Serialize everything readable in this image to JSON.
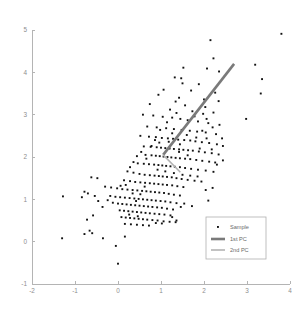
{
  "chart_data": {
    "type": "scatter",
    "title": "",
    "xlabel": "",
    "ylabel": "",
    "xlim": [
      -2,
      4
    ],
    "ylim": [
      -1,
      5
    ],
    "grid": false,
    "legend_position": "lower right",
    "xticks": [
      "-2",
      "-1",
      "0",
      "1",
      "2",
      "3",
      "4"
    ],
    "xtick_values": [
      -2,
      -1,
      0,
      1,
      2,
      3,
      4
    ],
    "yticks": [
      "-1",
      "0",
      "1",
      "2",
      "3",
      "4",
      "5"
    ],
    "ytick_values": [
      -1,
      0,
      1,
      2,
      3,
      4,
      5
    ],
    "legend": [
      {
        "label": "Sample",
        "marker": "point",
        "color": "#121212"
      },
      {
        "label": "1st PC",
        "marker": "line",
        "color": "#7a7a7a",
        "width": 2.6
      },
      {
        "label": "2nd PC",
        "marker": "line",
        "color": "#b3b3b3",
        "width": 1.6
      }
    ],
    "series": [
      {
        "name": "Sample",
        "type": "scatter",
        "marker": "square",
        "marker_size": 1.9,
        "color": "#121212",
        "points": [
          [
            3.8,
            4.91
          ],
          [
            2.15,
            4.76
          ],
          [
            2.22,
            4.33
          ],
          [
            1.52,
            4.11
          ],
          [
            2.07,
            4.09
          ],
          [
            2.35,
            4.02
          ],
          [
            3.19,
            4.18
          ],
          [
            3.35,
            3.84
          ],
          [
            1.32,
            3.88
          ],
          [
            1.47,
            3.86
          ],
          [
            1.5,
            3.74
          ],
          [
            1.88,
            3.72
          ],
          [
            3.32,
            3.5
          ],
          [
            1.06,
            3.59
          ],
          [
            1.7,
            3.57
          ],
          [
            2.26,
            3.52
          ],
          [
            0.94,
            3.47
          ],
          [
            1.42,
            3.4
          ],
          [
            2.0,
            3.36
          ],
          [
            1.34,
            3.31
          ],
          [
            0.74,
            3.25
          ],
          [
            1.56,
            3.22
          ],
          [
            2.03,
            3.18
          ],
          [
            1.21,
            3.12
          ],
          [
            1.73,
            3.08
          ],
          [
            2.22,
            3.05
          ],
          [
            2.98,
            2.9
          ],
          [
            0.58,
            3.0
          ],
          [
            0.82,
            2.98
          ],
          [
            1.04,
            2.95
          ],
          [
            1.26,
            2.93
          ],
          [
            1.45,
            2.9
          ],
          [
            1.62,
            2.87
          ],
          [
            1.86,
            2.84
          ],
          [
            2.1,
            2.8
          ],
          [
            2.36,
            2.76
          ],
          [
            0.68,
            2.72
          ],
          [
            0.9,
            2.7
          ],
          [
            1.12,
            2.68
          ],
          [
            1.3,
            2.66
          ],
          [
            1.48,
            2.64
          ],
          [
            1.67,
            2.62
          ],
          [
            1.84,
            2.6
          ],
          [
            2.04,
            2.58
          ],
          [
            2.28,
            2.54
          ],
          [
            0.52,
            2.5
          ],
          [
            0.72,
            2.48
          ],
          [
            0.88,
            2.47
          ],
          [
            1.02,
            2.45
          ],
          [
            1.16,
            2.44
          ],
          [
            1.28,
            2.43
          ],
          [
            1.4,
            2.41
          ],
          [
            1.54,
            2.4
          ],
          [
            1.68,
            2.39
          ],
          [
            1.8,
            2.37
          ],
          [
            1.95,
            2.35
          ],
          [
            2.12,
            2.33
          ],
          [
            2.3,
            2.3
          ],
          [
            2.44,
            2.26
          ],
          [
            0.6,
            2.25
          ],
          [
            0.76,
            2.24
          ],
          [
            0.9,
            2.23
          ],
          [
            1.0,
            2.22
          ],
          [
            1.1,
            2.21
          ],
          [
            1.2,
            2.2
          ],
          [
            1.3,
            2.19
          ],
          [
            1.42,
            2.18
          ],
          [
            1.52,
            2.17
          ],
          [
            1.63,
            2.16
          ],
          [
            1.74,
            2.15
          ],
          [
            1.88,
            2.13
          ],
          [
            2.02,
            2.11
          ],
          [
            2.18,
            2.09
          ],
          [
            2.34,
            2.06
          ],
          [
            0.64,
            2.05
          ],
          [
            0.78,
            2.04
          ],
          [
            0.88,
            2.03
          ],
          [
            0.97,
            2.02
          ],
          [
            1.06,
            2.01
          ],
          [
            1.15,
            2.0
          ],
          [
            1.24,
            1.99
          ],
          [
            1.34,
            1.98
          ],
          [
            1.44,
            1.97
          ],
          [
            1.56,
            1.96
          ],
          [
            1.68,
            1.95
          ],
          [
            1.82,
            1.93
          ],
          [
            1.96,
            1.91
          ],
          [
            2.12,
            1.89
          ],
          [
            2.26,
            1.87
          ],
          [
            2.44,
            1.92
          ],
          [
            0.46,
            1.85
          ],
          [
            0.6,
            1.84
          ],
          [
            0.72,
            1.83
          ],
          [
            0.84,
            1.82
          ],
          [
            0.94,
            1.81
          ],
          [
            1.03,
            1.8
          ],
          [
            1.12,
            1.79
          ],
          [
            1.22,
            1.78
          ],
          [
            1.32,
            1.77
          ],
          [
            1.44,
            1.76
          ],
          [
            1.56,
            1.74
          ],
          [
            1.7,
            1.72
          ],
          [
            1.86,
            1.7
          ],
          [
            2.04,
            1.68
          ],
          [
            2.22,
            1.65
          ],
          [
            -0.62,
            1.52
          ],
          [
            -0.48,
            1.5
          ],
          [
            0.22,
            1.66
          ],
          [
            0.36,
            1.63
          ],
          [
            0.5,
            1.6
          ],
          [
            0.62,
            1.58
          ],
          [
            0.74,
            1.57
          ],
          [
            0.85,
            1.56
          ],
          [
            0.95,
            1.55
          ],
          [
            1.04,
            1.54
          ],
          [
            1.14,
            1.53
          ],
          [
            1.25,
            1.52
          ],
          [
            1.36,
            1.5
          ],
          [
            1.48,
            1.48
          ],
          [
            1.62,
            1.46
          ],
          [
            1.78,
            1.44
          ],
          [
            1.94,
            1.42
          ],
          [
            0.14,
            1.45
          ],
          [
            0.28,
            1.43
          ],
          [
            0.4,
            1.41
          ],
          [
            0.52,
            1.4
          ],
          [
            0.63,
            1.39
          ],
          [
            0.74,
            1.38
          ],
          [
            0.84,
            1.37
          ],
          [
            0.94,
            1.36
          ],
          [
            1.04,
            1.35
          ],
          [
            1.14,
            1.34
          ],
          [
            1.26,
            1.33
          ],
          [
            1.38,
            1.31
          ],
          [
            1.52,
            1.29
          ],
          [
            2.2,
            1.27
          ],
          [
            2.04,
            1.22
          ],
          [
            -0.78,
            1.18
          ],
          [
            -0.7,
            1.14
          ],
          [
            -0.3,
            1.3
          ],
          [
            -0.16,
            1.28
          ],
          [
            -0.02,
            1.26
          ],
          [
            0.1,
            1.24
          ],
          [
            0.22,
            1.23
          ],
          [
            0.34,
            1.22
          ],
          [
            0.45,
            1.21
          ],
          [
            0.56,
            1.2
          ],
          [
            0.66,
            1.19
          ],
          [
            0.76,
            1.18
          ],
          [
            0.86,
            1.17
          ],
          [
            0.96,
            1.16
          ],
          [
            1.07,
            1.15
          ],
          [
            1.18,
            1.13
          ],
          [
            1.3,
            1.11
          ],
          [
            1.44,
            1.09
          ],
          [
            -1.28,
            1.07
          ],
          [
            -0.84,
            1.05
          ],
          [
            -0.18,
            1.08
          ],
          [
            -0.06,
            1.06
          ],
          [
            0.05,
            1.05
          ],
          [
            0.16,
            1.04
          ],
          [
            0.27,
            1.03
          ],
          [
            0.38,
            1.02
          ],
          [
            0.48,
            1.01
          ],
          [
            0.58,
            1.0
          ],
          [
            0.68,
            0.99
          ],
          [
            0.78,
            0.98
          ],
          [
            0.88,
            0.97
          ],
          [
            0.99,
            0.96
          ],
          [
            1.1,
            0.95
          ],
          [
            1.22,
            0.93
          ],
          [
            1.36,
            0.91
          ],
          [
            1.54,
            0.9
          ],
          [
            2.1,
            0.97
          ],
          [
            1.72,
            0.84
          ],
          [
            -0.12,
            0.92
          ],
          [
            0.0,
            0.9
          ],
          [
            0.1,
            0.89
          ],
          [
            0.2,
            0.88
          ],
          [
            0.3,
            0.87
          ],
          [
            0.4,
            0.86
          ],
          [
            0.5,
            0.85
          ],
          [
            0.6,
            0.84
          ],
          [
            0.7,
            0.83
          ],
          [
            0.8,
            0.82
          ],
          [
            0.91,
            0.81
          ],
          [
            1.02,
            0.8
          ],
          [
            1.14,
            0.78
          ],
          [
            1.28,
            0.76
          ],
          [
            1.46,
            0.82
          ],
          [
            0.04,
            0.74
          ],
          [
            0.14,
            0.73
          ],
          [
            0.24,
            0.72
          ],
          [
            0.34,
            0.71
          ],
          [
            0.44,
            0.7
          ],
          [
            0.54,
            0.69
          ],
          [
            0.64,
            0.68
          ],
          [
            0.74,
            0.67
          ],
          [
            0.85,
            0.66
          ],
          [
            0.96,
            0.65
          ],
          [
            1.08,
            0.64
          ],
          [
            1.22,
            0.62
          ],
          [
            -0.58,
            0.62
          ],
          [
            -0.72,
            0.52
          ],
          [
            0.08,
            0.58
          ],
          [
            0.18,
            0.57
          ],
          [
            0.28,
            0.56
          ],
          [
            0.38,
            0.55
          ],
          [
            0.48,
            0.54
          ],
          [
            0.58,
            0.53
          ],
          [
            0.68,
            0.52
          ],
          [
            0.8,
            0.51
          ],
          [
            0.92,
            0.5
          ],
          [
            1.06,
            0.48
          ],
          [
            1.2,
            0.47
          ],
          [
            1.34,
            0.46
          ],
          [
            1.36,
            0.5
          ],
          [
            0.16,
            0.42
          ],
          [
            0.3,
            0.41
          ],
          [
            0.44,
            0.4
          ],
          [
            0.58,
            0.39
          ],
          [
            0.72,
            0.38
          ],
          [
            0.88,
            0.44
          ],
          [
            1.02,
            0.43
          ],
          [
            -0.66,
            0.26
          ],
          [
            -0.6,
            0.2
          ],
          [
            -0.78,
            0.18
          ],
          [
            -0.35,
            0.08
          ],
          [
            -1.3,
            0.08
          ],
          [
            0.16,
            0.12
          ],
          [
            -0.05,
            -0.1
          ],
          [
            0.0,
            -0.52
          ],
          [
            1.96,
            2.62
          ],
          [
            2.06,
            2.44
          ],
          [
            1.9,
            2.2
          ],
          [
            2.2,
            2.7
          ],
          [
            1.14,
            2.82
          ],
          [
            0.98,
            2.64
          ],
          [
            0.86,
            2.4
          ],
          [
            1.26,
            2.56
          ],
          [
            1.6,
            2.52
          ],
          [
            1.44,
            2.3
          ],
          [
            0.66,
            1.96
          ],
          [
            0.54,
            2.12
          ],
          [
            0.44,
            2.02
          ],
          [
            0.36,
            1.88
          ],
          [
            0.28,
            1.76
          ],
          [
            0.92,
            1.7
          ],
          [
            1.1,
            1.66
          ],
          [
            1.3,
            1.62
          ],
          [
            1.5,
            1.58
          ],
          [
            1.68,
            1.56
          ],
          [
            1.85,
            1.54
          ],
          [
            0.18,
            1.34
          ],
          [
            0.06,
            1.32
          ],
          [
            -0.24,
            0.98
          ],
          [
            -0.36,
            0.82
          ],
          [
            -0.46,
            0.96
          ],
          [
            -0.54,
            1.08
          ],
          [
            2.3,
            1.82
          ],
          [
            2.42,
            2.44
          ],
          [
            2.34,
            3.32
          ],
          [
            1.98,
            3.02
          ],
          [
            1.78,
            2.96
          ],
          [
            1.36,
            3.04
          ],
          [
            0.78,
            2.26
          ],
          [
            0.96,
            2.34
          ],
          [
            1.18,
            2.36
          ],
          [
            1.42,
            2.12
          ],
          [
            1.62,
            2.04
          ],
          [
            1.82,
            2.46
          ],
          [
            2.06,
            2.9
          ],
          [
            2.18,
            2.18
          ],
          [
            0.42,
            0.96
          ],
          [
            0.52,
            1.12
          ],
          [
            0.34,
            1.14
          ],
          [
            0.62,
            1.3
          ],
          [
            0.26,
            0.64
          ],
          [
            0.46,
            0.6
          ],
          [
            1.26,
            0.58
          ]
        ]
      },
      {
        "name": "1st PC",
        "type": "line",
        "color": "#7a7a7a",
        "width": 2.6,
        "points": [
          [
            1.05,
            2.05
          ],
          [
            2.7,
            4.2
          ]
        ]
      },
      {
        "name": "2nd PC",
        "type": "line",
        "color": "#b3b3b3",
        "width": 1.6,
        "points": [
          [
            1.05,
            2.05
          ],
          [
            1.45,
            1.64
          ]
        ]
      }
    ]
  },
  "colors": {
    "background": "#ffffff",
    "axis": "#b4b4b4",
    "tick_text": "#8e8e8e",
    "marker": "#121212",
    "pc1": "#7a7a7a",
    "pc2": "#b3b3b3",
    "legend_border": "#b0b0b0"
  }
}
